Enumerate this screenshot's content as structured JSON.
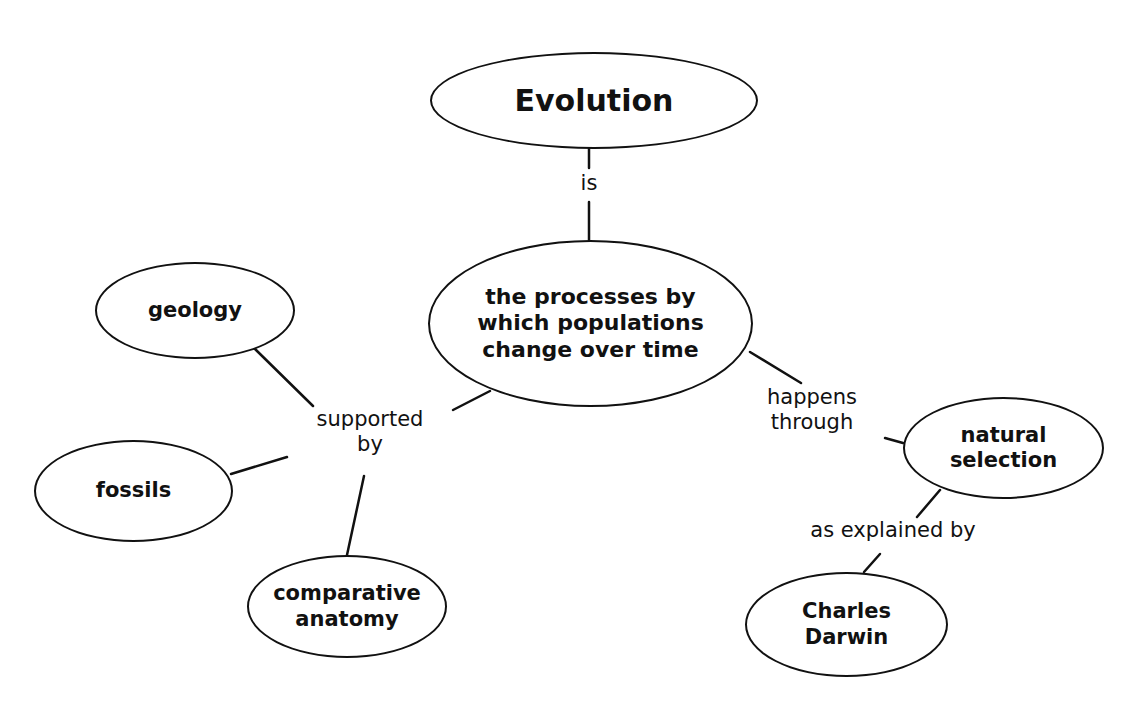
{
  "diagram": {
    "type": "concept-map",
    "nodes": {
      "evolution": "Evolution",
      "central": "the processes by\nwhich populations\nchange over time",
      "geology": "geology",
      "fossils": "fossils",
      "comparative": "comparative\nanatomy",
      "natural": "natural\nselection",
      "darwin": "Charles\nDarwin"
    },
    "links": {
      "is": "is",
      "supported_by": "supported\nby",
      "happens_through": "happens\nthrough",
      "explained_by": "as explained by"
    },
    "edges": [
      {
        "from": "Evolution",
        "to": "the processes by which populations change over time",
        "label": "is"
      },
      {
        "from": "the processes by which populations change over time",
        "to": "geology",
        "label": "supported by"
      },
      {
        "from": "the processes by which populations change over time",
        "to": "fossils",
        "label": "supported by"
      },
      {
        "from": "the processes by which populations change over time",
        "to": "comparative anatomy",
        "label": "supported by"
      },
      {
        "from": "the processes by which populations change over time",
        "to": "natural selection",
        "label": "happens through"
      },
      {
        "from": "natural selection",
        "to": "Charles Darwin",
        "label": "as explained by"
      }
    ]
  }
}
